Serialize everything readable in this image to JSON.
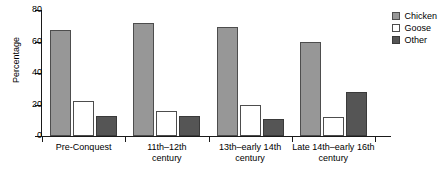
{
  "chart_data": {
    "type": "bar",
    "title": "",
    "xlabel": "",
    "ylabel": "Percentage",
    "ylim": [
      0,
      80
    ],
    "yticks": [
      0,
      20,
      40,
      60,
      80
    ],
    "grid": false,
    "legend_position": "top-right",
    "categories": [
      "Pre-Conquest",
      "11th–12th century",
      "13th–early 14th century",
      "Late 14th–early 16th century"
    ],
    "category_lines": [
      [
        "Pre-Conquest",
        ""
      ],
      [
        "11th–12th",
        "century"
      ],
      [
        "13th–early 14th",
        "century"
      ],
      [
        "Late 14th–early 16th",
        "century"
      ]
    ],
    "series": [
      {
        "name": "Chicken",
        "color": "#979797",
        "values": [
          67,
          72,
          69,
          60
        ]
      },
      {
        "name": "Goose",
        "color": "#ffffff",
        "values": [
          22,
          16,
          20,
          12
        ]
      },
      {
        "name": "Other",
        "color": "#555555",
        "values": [
          13,
          13,
          11,
          28
        ]
      }
    ]
  },
  "legend": {
    "items": [
      {
        "label": "Chicken"
      },
      {
        "label": "Goose"
      },
      {
        "label": "Other"
      }
    ]
  },
  "axis": {
    "y_label": "Percentage",
    "y_tick_labels": [
      "80",
      "60",
      "40",
      "20",
      "0"
    ]
  }
}
